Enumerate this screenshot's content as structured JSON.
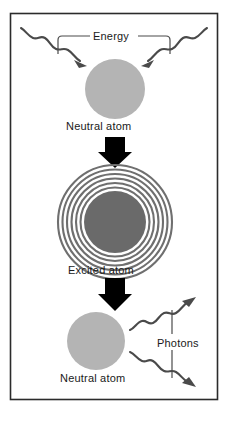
{
  "figure": {
    "border_color": "#2b2b2b",
    "background": "#ffffff"
  },
  "labels": {
    "energy": "Energy",
    "neutral_atom_top": "Neutral atom",
    "excited_atom": "Excited atom",
    "neutral_atom_bottom": "Neutral atom",
    "photons": "Photons"
  },
  "colors": {
    "neutral_atom_fill": "#b4b4b4",
    "excited_core_fill": "#6a6a6a",
    "ring_stroke": "#6f6f6f",
    "arrow_black": "#000000",
    "squiggle_stroke": "#4a4a4a",
    "bracket_stroke": "#4a4a4a",
    "text": "#1a1a1a"
  },
  "stages": [
    {
      "name": "neutral-atom-top",
      "label": "Neutral atom",
      "cx": 115,
      "cy": 89,
      "r": 30,
      "fill": "#b4b4b4"
    },
    {
      "name": "excited-atom",
      "label": "Excited atom",
      "cx": 115,
      "cy": 222,
      "core_r": 32,
      "ring_count": 7,
      "outer_r": 58,
      "core_fill": "#6a6a6a"
    },
    {
      "name": "neutral-atom-bottom",
      "label": "Neutral atom",
      "cx": 96,
      "cy": 341,
      "r": 29,
      "fill": "#b4b4b4"
    }
  ],
  "energy_inputs": [
    {
      "name": "energy-squiggle-left",
      "direction": "down-right"
    },
    {
      "name": "energy-squiggle-right",
      "direction": "down-left"
    }
  ],
  "photon_outputs": [
    {
      "name": "photon-squiggle-upper",
      "direction": "up-right"
    },
    {
      "name": "photon-squiggle-lower",
      "direction": "down-right"
    }
  ],
  "transition_arrows": [
    {
      "name": "arrow-absorb",
      "direction": "down",
      "from": "neutral-atom-top",
      "to": "excited-atom"
    },
    {
      "name": "arrow-emit",
      "direction": "down",
      "from": "excited-atom",
      "to": "neutral-atom-bottom"
    }
  ]
}
